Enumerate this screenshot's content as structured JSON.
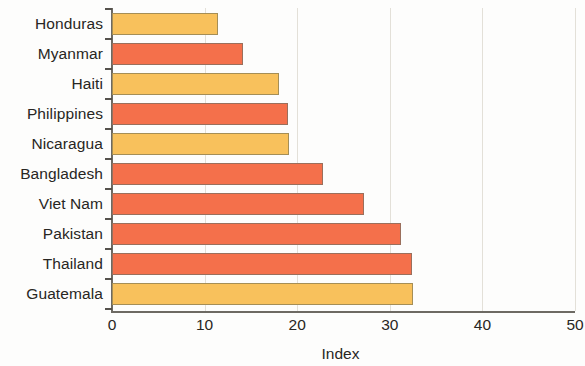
{
  "chart_data": {
    "type": "bar",
    "orientation": "horizontal",
    "title": "",
    "xlabel": "Index",
    "ylabel": "",
    "xlim": [
      0,
      50
    ],
    "xticks": [
      0,
      10,
      20,
      30,
      40,
      50
    ],
    "grid": true,
    "legend": "none",
    "categories": [
      "Honduras",
      "Myanmar",
      "Haiti",
      "Philippines",
      "Nicaragua",
      "Bangladesh",
      "Viet Nam",
      "Pakistan",
      "Thailand",
      "Guatemala"
    ],
    "values": [
      11.5,
      14.2,
      18.0,
      19.0,
      19.1,
      22.8,
      27.2,
      31.2,
      32.4,
      32.5
    ],
    "bar_colors": [
      "#f8c15c",
      "#f4704b",
      "#f8c15c",
      "#f4704b",
      "#f8c15c",
      "#f4704b",
      "#f4704b",
      "#f4704b",
      "#f4704b",
      "#f8c15c"
    ],
    "palette": {
      "orange": "#f4704b",
      "yellow": "#f8c15c",
      "axis": "#6d6a63",
      "grid": "#e3e0d8",
      "text": "#282623",
      "background": "#fdfdfc"
    }
  }
}
